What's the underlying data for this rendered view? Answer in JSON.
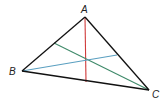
{
  "diagram": {
    "type": "triangle-with-cevians",
    "vertices": [
      {
        "id": "A",
        "label": "A"
      },
      {
        "id": "B",
        "label": "B"
      },
      {
        "id": "C",
        "label": "C"
      }
    ],
    "sides": [
      {
        "from": "A",
        "to": "B"
      },
      {
        "from": "B",
        "to": "C"
      },
      {
        "from": "C",
        "to": "A"
      }
    ],
    "cevians": [
      {
        "from": "A",
        "to_side": "BC",
        "color": "#d03a3a"
      },
      {
        "from": "C",
        "to_side": "AB",
        "color": "#3f8a6a"
      },
      {
        "from": "B",
        "to_side": "AC",
        "color": "#5a9fc0"
      }
    ],
    "concurrent": true,
    "colors": {
      "side": "#111111",
      "label": "#222222"
    }
  }
}
